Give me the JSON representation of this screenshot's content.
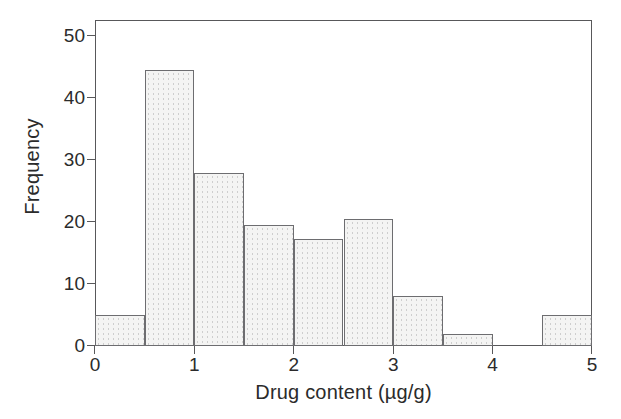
{
  "chart_data": {
    "type": "bar",
    "chart_subtype": "histogram",
    "title": "",
    "xlabel": "Drug content (µg/g)",
    "ylabel": "Frequency",
    "xlim": [
      0,
      5
    ],
    "ylim": [
      0,
      52.5
    ],
    "xticks": [
      0,
      1,
      2,
      3,
      4,
      5
    ],
    "xtick_labels": [
      "0",
      "1",
      "2",
      "3",
      "4",
      "5"
    ],
    "yticks": [
      0,
      10,
      20,
      30,
      40,
      50
    ],
    "ytick_labels": [
      "0",
      "10",
      "20",
      "30",
      "40",
      "50"
    ],
    "grid": false,
    "legend": null,
    "bin_width": 0.5,
    "bin_edges": [
      0,
      0.5,
      1.0,
      1.5,
      2.0,
      2.5,
      3.0,
      3.5,
      4.0,
      4.5,
      5.0
    ],
    "categories": [
      "0-0.5",
      "0.5-1.0",
      "1.0-1.5",
      "1.5-2.0",
      "2.0-2.5",
      "2.5-3.0",
      "3.0-3.5",
      "3.5-4.0",
      "4.0-4.5",
      "4.5-5.0"
    ],
    "values": [
      5,
      44.5,
      27.8,
      19.5,
      17.3,
      20.5,
      8,
      2,
      0,
      5
    ],
    "bars": [
      {
        "label": "bin-0.0-0.5",
        "x0": 0.0,
        "x1": 0.5,
        "value": 5
      },
      {
        "label": "bin-0.5-1.0",
        "x0": 0.5,
        "x1": 1.0,
        "value": 44.5
      },
      {
        "label": "bin-1.0-1.5",
        "x0": 1.0,
        "x1": 1.5,
        "value": 27.8
      },
      {
        "label": "bin-1.5-2.0",
        "x0": 1.5,
        "x1": 2.0,
        "value": 19.5
      },
      {
        "label": "bin-2.0-2.5",
        "x0": 2.0,
        "x1": 2.5,
        "value": 17.3
      },
      {
        "label": "bin-2.5-3.0",
        "x0": 2.5,
        "x1": 3.0,
        "value": 20.5
      },
      {
        "label": "bin-3.0-3.5",
        "x0": 3.0,
        "x1": 3.5,
        "value": 8
      },
      {
        "label": "bin-3.5-4.0",
        "x0": 3.5,
        "x1": 4.0,
        "value": 2
      },
      {
        "label": "bin-4.0-4.5",
        "x0": 4.0,
        "x1": 4.5,
        "value": 0
      },
      {
        "label": "bin-4.5-5.0",
        "x0": 4.5,
        "x1": 5.0,
        "value": 5
      }
    ],
    "colors": {
      "bar_fill": "#f4f4f3",
      "bar_edge": "#6d6d70",
      "axis": "#58585a",
      "text": "#2b2b2b",
      "background": "#ffffff"
    }
  }
}
